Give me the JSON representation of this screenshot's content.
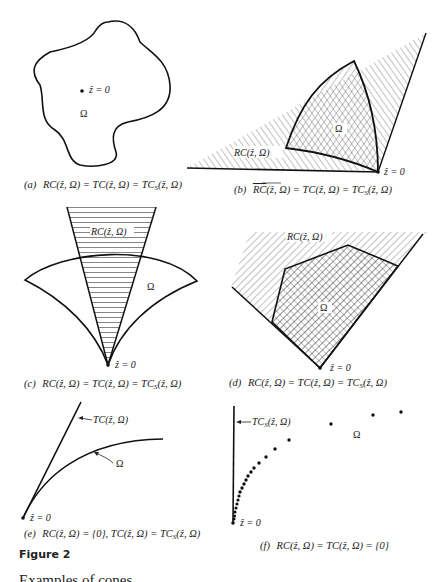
{
  "figure": {
    "title": "Figure 2",
    "trailing_text": "Examples of cones",
    "panels": [
      {
        "id": "a",
        "caption_marker": "(a)",
        "caption": "RC(ẑ, Ω) = TC(ẑ, Ω) = TC_S(ẑ, Ω)",
        "point_label": "ẑ = 0",
        "set_label": "Ω"
      },
      {
        "id": "b",
        "caption_marker": "(b)",
        "caption": "RC(ẑ, Ω) = TC(ẑ, Ω) = TC_S(ẑ, Ω)",
        "caption_overline_first": true,
        "point_label": "ẑ = 0",
        "set_label": "Ω",
        "cone_label": "RC(ẑ, Ω)"
      },
      {
        "id": "c",
        "caption_marker": "(c)",
        "caption": "RC(ẑ, Ω) = TC(ẑ, Ω) = TC_S(ẑ, Ω)",
        "point_label": "ẑ = 0",
        "set_label": "Ω",
        "cone_label": "RC(ẑ, Ω)"
      },
      {
        "id": "d",
        "caption_marker": "(d)",
        "caption": "RC(ẑ, Ω) = TC(ẑ, Ω) = TC_S(ẑ, Ω)",
        "point_label": "ẑ = 0",
        "set_label": "Ω",
        "cone_label": "RC(ẑ, Ω)"
      },
      {
        "id": "e",
        "caption_marker": "(e)",
        "caption": "RC(ẑ, Ω) = {0}, TC(ẑ, Ω) = TC_S(ẑ, Ω)",
        "point_label": "ẑ = 0",
        "set_label": "Ω",
        "cone_label": "TC(ẑ, Ω)"
      },
      {
        "id": "f",
        "caption_marker": "(f)",
        "caption": "RC(ẑ, Ω) = TC(ẑ, Ω) = {0}",
        "point_label": "ẑ = 0",
        "set_label": "Ω",
        "cone_label": "TC_S(ẑ, Ω)"
      }
    ]
  },
  "text": {
    "a_marker": "(a)",
    "a_eq": "RC(ẑ, Ω) = TC(ẑ, Ω) = TC",
    "a_sub": "S",
    "a_tail": "(ẑ, Ω)",
    "b_marker": "(b)",
    "b_over": "RC",
    "b_eq": "(ẑ, Ω) = TC(ẑ, Ω) = TC",
    "b_sub": "S",
    "b_tail": "(ẑ, Ω)",
    "c_marker": "(c)",
    "c_eq": "RC(ẑ, Ω) = TC(ẑ, Ω) = TC",
    "c_sub": "S",
    "c_tail": "(ẑ, Ω)",
    "d_marker": "(d)",
    "d_eq": "RC(ẑ, Ω) = TC(ẑ, Ω) = TC",
    "d_sub": "S",
    "d_tail": "(ẑ, Ω)",
    "e_marker": "(e)",
    "e_eq": "RC(ẑ, Ω) = {0}, TC(ẑ, Ω) = TC",
    "e_sub": "S",
    "e_tail": "(ẑ, Ω)",
    "f_marker": "(f)",
    "f_eq": "RC(ẑ, Ω) = TC(ẑ, Ω) = {0}",
    "z0": "ẑ = 0",
    "omega": "Ω",
    "rc_label": "RC(ẑ, Ω)",
    "tc_label": "TC(ẑ, Ω)",
    "tcs_label_main": "TC",
    "tcs_label_sub": "S",
    "tcs_label_tail": "(ẑ, Ω)"
  }
}
